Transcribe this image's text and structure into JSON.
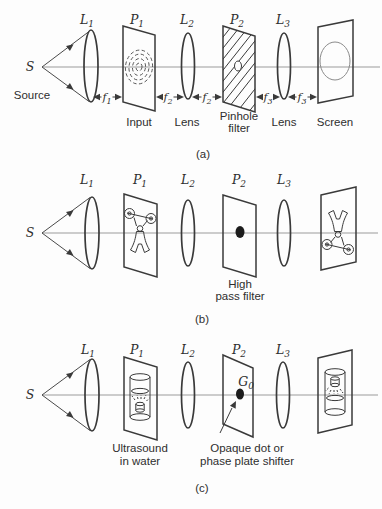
{
  "figure": {
    "captions": {
      "a": "(a)",
      "b": "(b)",
      "c": "(c)"
    },
    "source": {
      "symbol": "S",
      "label": "Source"
    },
    "component_heads": {
      "l1": {
        "base": "L",
        "sub": "1"
      },
      "p1": {
        "base": "P",
        "sub": "1"
      },
      "l2": {
        "base": "L",
        "sub": "2"
      },
      "p2": {
        "base": "P",
        "sub": "2"
      },
      "l3": {
        "base": "L",
        "sub": "3"
      }
    },
    "row_a": {
      "f1": {
        "base": "f",
        "sub": "1"
      },
      "f2": {
        "base": "f",
        "sub": "2"
      },
      "f3": {
        "base": "f",
        "sub": "3"
      },
      "labels": {
        "input": "Input",
        "lens2": "Lens",
        "filter_line1": "Pinhole",
        "filter_line2": "filter",
        "lens3": "Lens",
        "screen": "Screen"
      }
    },
    "row_b": {
      "filter_line1": "High",
      "filter_line2": "pass filter"
    },
    "row_c": {
      "g0": {
        "base": "G",
        "sub": "0"
      },
      "plate1_line1": "Ultrasound",
      "plate1_line2": "in water",
      "filter_line1": "Opaque dot or",
      "filter_line2": "phase plate shifter"
    },
    "colors": {
      "ink": "#3a3a3a",
      "axis_line": "#9b9b9b",
      "text": "#2e2e2e",
      "screen_circle": "#8a8a8a",
      "dot": "#1c1c1c",
      "background": "#fdfdfd"
    }
  }
}
